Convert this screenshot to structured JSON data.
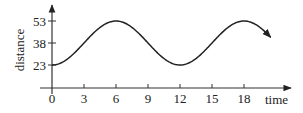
{
  "chart_data": {
    "type": "line",
    "title": "",
    "xlabel": "time",
    "ylabel": "distance",
    "x_ticks": [
      0,
      3,
      6,
      9,
      12,
      15,
      18
    ],
    "y_ticks": [
      23,
      38,
      53
    ],
    "xlim": [
      0,
      21
    ],
    "ylim": [
      13,
      64
    ],
    "grid": false,
    "legend": null,
    "function": "d(t) = 38 - 15*cos(pi*t/6)",
    "series": [
      {
        "name": "distance",
        "x": [
          0,
          1.5,
          3,
          4.5,
          6,
          7.5,
          9,
          10.5,
          12,
          13.5,
          15,
          16.5,
          18,
          19.5,
          20.5
        ],
        "values": [
          23,
          27.4,
          38,
          48.6,
          53,
          48.6,
          38,
          27.4,
          23,
          27.4,
          38,
          48.6,
          53,
          48.6,
          42
        ],
        "end_arrow": true
      }
    ],
    "colors": {
      "line": "#222222",
      "axis": "#333333"
    }
  }
}
